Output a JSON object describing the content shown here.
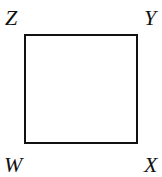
{
  "diagram": {
    "shape": "square",
    "vertices": {
      "top_left": "Z",
      "top_right": "Y",
      "bottom_left": "W",
      "bottom_right": "X"
    },
    "stroke_color": "#111111"
  }
}
